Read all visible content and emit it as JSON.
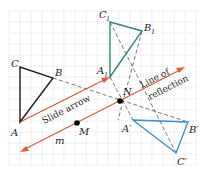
{
  "diagram": {
    "colors": {
      "grid": "#c8c8c8",
      "original_triangle": "#231f20",
      "translated_triangle": "#2e8b6a",
      "reflected_triangle": "#3b8fd4",
      "arrow": "#e05a3c",
      "dashed": "#555555"
    },
    "triangles": {
      "original": {
        "vertices": [
          "A",
          "B",
          "C"
        ]
      },
      "translated": {
        "vertices": [
          "A1",
          "B1",
          "C1"
        ]
      },
      "reflected": {
        "vertices": [
          "A'",
          "B'",
          "C'"
        ]
      }
    },
    "labels": {
      "A": "A",
      "B": "B",
      "C": "C",
      "A1": "A",
      "A1_sub": "1",
      "B1": "B",
      "B1_sub": "1",
      "C1": "C",
      "C1_sub": "1",
      "Ap": "A′",
      "Bp": "B′",
      "Cp": "C′",
      "N": "N",
      "M": "M",
      "m": "m",
      "slide_arrow": "Slide arrow",
      "line_of": "Line of",
      "reflection": "reflection"
    }
  }
}
